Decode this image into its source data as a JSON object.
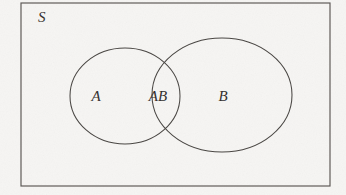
{
  "figure": {
    "type": "venn-diagram",
    "background_color": "#f6f5f3",
    "stroke_color": "#4a4744",
    "text_color": "#35312f",
    "universe": {
      "label": "S",
      "label_x": 38,
      "label_y": 22,
      "rect": {
        "x": 21,
        "y": 3,
        "width": 309,
        "height": 183
      }
    },
    "sets": [
      {
        "name": "set-a",
        "label": "A",
        "shape": "circle",
        "cx": 125,
        "cy": 96,
        "rx": 55,
        "ry": 48,
        "label_x": 96,
        "label_y": 101
      },
      {
        "name": "set-b",
        "label": "B",
        "shape": "ellipse",
        "cx": 222,
        "cy": 95,
        "rx": 70,
        "ry": 57,
        "label_x": 223,
        "label_y": 101
      }
    ],
    "intersection": {
      "name": "set-a-intersect-b",
      "label": "AB",
      "label_x": 158,
      "label_y": 101
    }
  }
}
